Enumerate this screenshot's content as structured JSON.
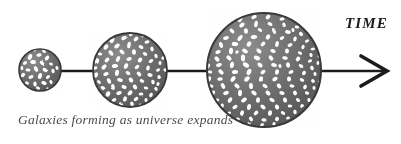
{
  "figure": {
    "kind": "scientific-illustration",
    "title_label": "TIME",
    "caption": "Galaxies forming as universe expands",
    "background_color": "#ffffff",
    "ink_color": "#1c1c1c",
    "caption_color": "#4a4a4a",
    "sphere_fill_color": "#6b6b6b",
    "sphere_edge_color": "#3a3a3a",
    "galaxy_color": "#ffffff",
    "axis": {
      "name": "time-axis",
      "direction": "left-to-right",
      "arrowhead": "chevron-right",
      "line_color": "#1c1c1c",
      "line_thickness_px": 2,
      "y_px": 71,
      "start_x_px": 19,
      "end_x_px": 386
    },
    "stages": [
      {
        "name": "universe-stage-early",
        "order": 1,
        "center_x_px": 40,
        "center_y_px": 70,
        "radius_px": 21,
        "galaxy_count": 26,
        "description": "small early universe with few galaxies"
      },
      {
        "name": "universe-stage-middle",
        "order": 2,
        "center_x_px": 130,
        "center_y_px": 70,
        "radius_px": 37,
        "galaxy_count": 74,
        "description": "expanded universe with more galaxies"
      },
      {
        "name": "universe-stage-late",
        "order": 3,
        "center_x_px": 264,
        "center_y_px": 70,
        "radius_px": 57,
        "galaxy_count": 150,
        "description": "largest universe with many galaxies"
      }
    ],
    "connectors": [
      {
        "name": "connector-1-2",
        "from_x_px": 59,
        "to_x_px": 95,
        "y_px": 71
      },
      {
        "name": "connector-2-3",
        "from_x_px": 165,
        "to_x_px": 209,
        "y_px": 71
      },
      {
        "name": "connector-3-arrow",
        "from_x_px": 319,
        "to_x_px": 386,
        "y_px": 71
      }
    ]
  }
}
